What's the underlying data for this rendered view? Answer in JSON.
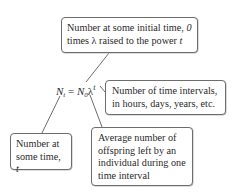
{
  "equation": {
    "lhs": "N",
    "lhs_sub": "t",
    "equals": " = ",
    "rhs": "N",
    "rhs_sub": "0",
    "lambda": "λ",
    "exponent": "t"
  },
  "boxes": {
    "top": {
      "line1_a": "Number at some initial time, ",
      "line1_b": "0",
      "line2_a": "times λ raised to the power ",
      "line2_b": "t"
    },
    "right": {
      "line1": "Number of time intervals,",
      "line2": "in hours, days, years, etc."
    },
    "left": {
      "line1": "Number at",
      "line2_a": "some time, ",
      "line2_b": "t"
    },
    "bottom": {
      "line1": "Average number of",
      "line2": "offspring left by an",
      "line3": "individual during one",
      "line4": "time interval"
    }
  },
  "colors": {
    "line": "#6d6d6d",
    "text": "#2a2a2a"
  }
}
